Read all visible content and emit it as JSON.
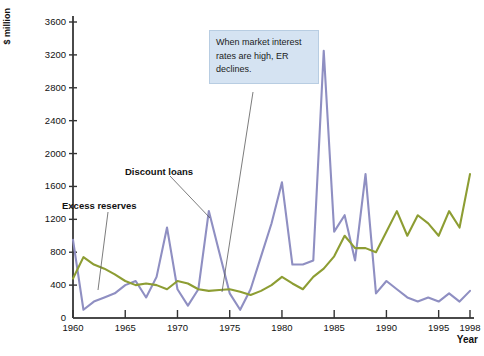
{
  "chart_data": {
    "type": "line",
    "title": "",
    "subtitle": "",
    "xlabel": "Year",
    "ylabel": "$ million",
    "xlim": [
      1960,
      1998
    ],
    "ylim": [
      0,
      3600
    ],
    "grid": false,
    "legend_position": "inline-labels",
    "y_ticks": [
      0,
      400,
      800,
      1200,
      1600,
      2000,
      2400,
      2800,
      3200,
      3600
    ],
    "x_ticks": [
      1960,
      1965,
      1970,
      1975,
      1980,
      1985,
      1990,
      1995,
      1998
    ],
    "x": [
      1960,
      1961,
      1962,
      1963,
      1964,
      1965,
      1966,
      1967,
      1968,
      1969,
      1970,
      1971,
      1972,
      1973,
      1974,
      1975,
      1976,
      1977,
      1978,
      1979,
      1980,
      1981,
      1982,
      1983,
      1984,
      1985,
      1986,
      1987,
      1988,
      1989,
      1990,
      1991,
      1992,
      1993,
      1994,
      1995,
      1996,
      1997,
      1998
    ],
    "series": [
      {
        "name": "Discount loans",
        "color": "#8f8fc2",
        "values": [
          950,
          100,
          200,
          250,
          300,
          400,
          450,
          250,
          500,
          1100,
          350,
          150,
          350,
          1300,
          800,
          300,
          100,
          350,
          750,
          1150,
          1650,
          650,
          650,
          700,
          3250,
          1050,
          1250,
          700,
          1750,
          300,
          450,
          350,
          250,
          200,
          250,
          200,
          300,
          200,
          330
        ]
      },
      {
        "name": "Excess reserves",
        "color": "#8d9d33",
        "values": [
          480,
          740,
          650,
          600,
          530,
          450,
          400,
          420,
          400,
          350,
          450,
          420,
          350,
          330,
          340,
          350,
          320,
          280,
          330,
          400,
          500,
          420,
          350,
          500,
          600,
          750,
          1000,
          850,
          850,
          800,
          1050,
          1300,
          1000,
          1250,
          1150,
          1000,
          1300,
          1100,
          1750
        ]
      }
    ],
    "annotations": [
      {
        "name": "callout-interest-rates",
        "text": "When market interest rates are high, ER declines."
      },
      {
        "name": "label-discount-loans",
        "text": "Discount loans"
      },
      {
        "name": "label-excess-reserves",
        "text": "Excess reserves"
      }
    ]
  },
  "axes": {
    "ylabel": "$ million",
    "xlabel": "Year",
    "y_tick_labels": [
      "3600",
      "3200",
      "2800",
      "2400",
      "2000",
      "1600",
      "1200",
      "800",
      "400",
      "0"
    ],
    "x_tick_labels": [
      "1960",
      "1965",
      "1970",
      "1975",
      "1980",
      "1985",
      "1990",
      "1995",
      "1998"
    ]
  },
  "labels": {
    "discount_loans": "Discount loans",
    "excess_reserves": "Excess reserves",
    "callout": "When market interest rates are high, ER declines."
  },
  "colors": {
    "discount_loans": "#8f8fc2",
    "excess_reserves": "#8d9d33",
    "axis": "#4a4a4a",
    "callout_bg": "#d5e3f2"
  }
}
